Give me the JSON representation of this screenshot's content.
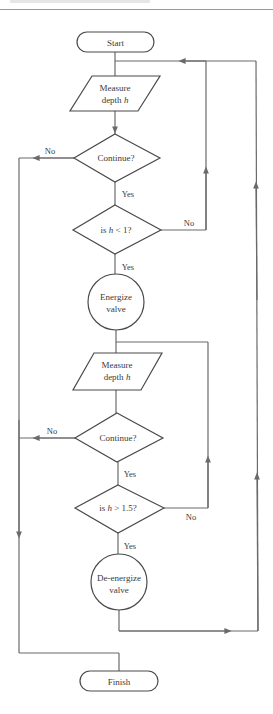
{
  "header": {
    "cut_text": "",
    "rule": true
  },
  "colors": {
    "line": "#6a6a6a",
    "text": "#3a3a3a",
    "background": "#ffffff"
  },
  "nodes": {
    "start": {
      "label": "Start",
      "shape": "terminator"
    },
    "measure1": {
      "line1": "Measure",
      "line2_prefix": "depth ",
      "line2_var": "h",
      "shape": "input-output"
    },
    "continue1": {
      "label": "Continue?",
      "shape": "decision"
    },
    "check_low": {
      "prefix": "is ",
      "var": "h",
      "suffix": " < 1?",
      "shape": "decision"
    },
    "energize": {
      "line1": "Energize",
      "line2": "valve",
      "shape": "process-circle"
    },
    "measure2": {
      "line1": "Measure",
      "line2_prefix": "depth ",
      "line2_var": "h",
      "shape": "input-output"
    },
    "continue2": {
      "label": "Continue?",
      "shape": "decision"
    },
    "check_high": {
      "prefix": "is ",
      "var": "h",
      "suffix": " > 1.5?",
      "shape": "decision"
    },
    "deenergize": {
      "line1": "De-energize",
      "line2": "valve",
      "shape": "process-circle"
    },
    "finish": {
      "label": "Finish",
      "shape": "terminator"
    }
  },
  "edge_labels": {
    "continue1_no": "No",
    "continue1_yes": "Yes",
    "check_low_no": "No",
    "check_low_yes": "Yes",
    "continue2_no": "No",
    "continue2_yes": "Yes",
    "check_high_no": "No",
    "check_high_yes": "Yes"
  }
}
